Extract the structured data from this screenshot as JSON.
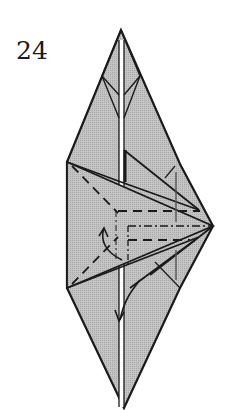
{
  "diagram": {
    "step_number": "24",
    "colors": {
      "paper_fill": "#b8b8b8",
      "paper_fill_light": "#cfcfcf",
      "line": "#1a1a1a",
      "background": "#ffffff"
    },
    "symbols": [
      "valley-fold-lines",
      "mountain-fold-line",
      "fold-arrow",
      "push-arrow"
    ]
  }
}
